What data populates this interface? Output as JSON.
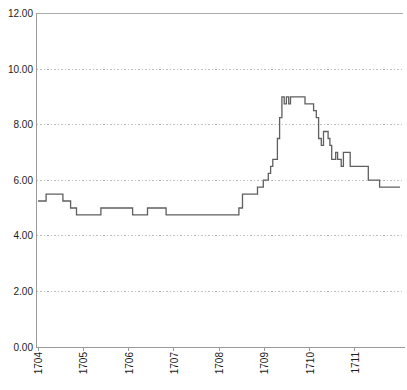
{
  "chart_data": {
    "type": "line",
    "subtype": "step-after",
    "title": "",
    "xlabel": "",
    "ylabel": "",
    "x_tick_labels": [
      "1704",
      "1705",
      "1706",
      "1707",
      "1708",
      "1709",
      "1710",
      "1711"
    ],
    "x_tick_years": [
      1704,
      1705,
      1706,
      1707,
      1708,
      1709,
      1710,
      1711
    ],
    "y_tick_labels": [
      "0.00",
      "2.00",
      "4.00",
      "6.00",
      "8.00",
      "10.00",
      "12.00"
    ],
    "y_tick_values": [
      0,
      2,
      4,
      6,
      8,
      10,
      12
    ],
    "xlim": [
      1704,
      1712.07
    ],
    "ylim": [
      0,
      12
    ],
    "grid": "horizontal-dotted",
    "legend": "none",
    "colors": {
      "line": "#5f5f5f",
      "axis": "#9a9a9a",
      "gridline": "#bdbdbd",
      "top_border": "#ababab",
      "label_text": "#1c1c1c",
      "background": "#ffffff"
    },
    "series": [
      {
        "name": "value",
        "step": "after",
        "end_x": 1712.0,
        "points": [
          [
            1704.0,
            5.25
          ],
          [
            1704.18,
            5.5
          ],
          [
            1704.55,
            5.25
          ],
          [
            1704.72,
            5.0
          ],
          [
            1704.85,
            4.75
          ],
          [
            1705.39,
            5.0
          ],
          [
            1706.09,
            4.75
          ],
          [
            1706.42,
            5.0
          ],
          [
            1706.83,
            4.75
          ],
          [
            1708.44,
            5.0
          ],
          [
            1708.52,
            5.5
          ],
          [
            1708.85,
            5.75
          ],
          [
            1708.98,
            6.0
          ],
          [
            1709.09,
            6.25
          ],
          [
            1709.14,
            6.5
          ],
          [
            1709.19,
            6.75
          ],
          [
            1709.29,
            7.5
          ],
          [
            1709.34,
            8.25
          ],
          [
            1709.39,
            9.0
          ],
          [
            1709.44,
            8.75
          ],
          [
            1709.49,
            9.0
          ],
          [
            1709.54,
            8.75
          ],
          [
            1709.58,
            9.0
          ],
          [
            1709.9,
            8.75
          ],
          [
            1710.09,
            8.5
          ],
          [
            1710.15,
            8.25
          ],
          [
            1710.2,
            7.5
          ],
          [
            1710.26,
            7.25
          ],
          [
            1710.31,
            7.75
          ],
          [
            1710.41,
            7.5
          ],
          [
            1710.45,
            7.25
          ],
          [
            1710.49,
            6.75
          ],
          [
            1710.58,
            7.0
          ],
          [
            1710.62,
            6.75
          ],
          [
            1710.7,
            6.5
          ],
          [
            1710.75,
            7.0
          ],
          [
            1710.9,
            6.5
          ],
          [
            1711.3,
            6.0
          ],
          [
            1711.55,
            5.75
          ]
        ]
      }
    ]
  }
}
